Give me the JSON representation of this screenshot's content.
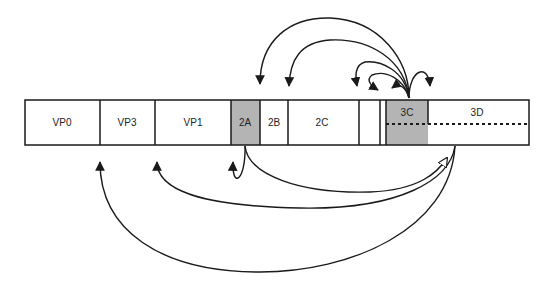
{
  "diagram": {
    "segments": [
      {
        "id": "vp0",
        "label": "VP0",
        "x": 25,
        "w": 75,
        "shaded": false
      },
      {
        "id": "vp3",
        "label": "VP3",
        "x": 100,
        "w": 55,
        "shaded": false
      },
      {
        "id": "vp1",
        "label": "VP1",
        "x": 155,
        "w": 76,
        "shaded": false
      },
      {
        "id": "2a",
        "label": "2A",
        "x": 231,
        "w": 29,
        "shaded": true
      },
      {
        "id": "2b",
        "label": "2B",
        "x": 260,
        "w": 28,
        "shaded": false
      },
      {
        "id": "2c",
        "label": "2C",
        "x": 288,
        "w": 71,
        "shaded": false
      },
      {
        "id": "blank1",
        "label": "",
        "x": 359,
        "w": 21,
        "shaded": false
      },
      {
        "id": "blank2",
        "label": "",
        "x": 380,
        "w": 6,
        "shaded": false
      },
      {
        "id": "3c",
        "label": "3C",
        "x": 386,
        "w": 42,
        "shaded": true
      },
      {
        "id": "3d",
        "label": "3D",
        "x": 428,
        "w": 101,
        "shaded": false
      }
    ],
    "colors": {
      "shade": "#b4b4b4",
      "line": "#1a1a1a",
      "background": "#ffffff"
    }
  }
}
